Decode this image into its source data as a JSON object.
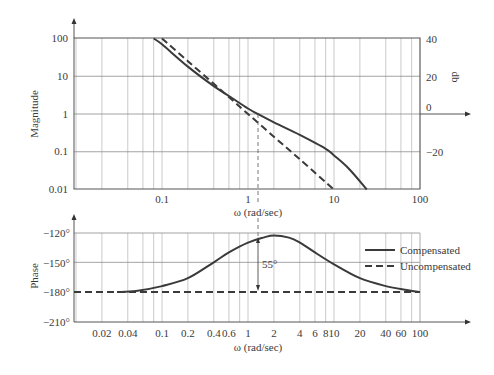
{
  "chart_data": [
    {
      "type": "line",
      "title": "",
      "xlabel": "ω (rad/sec)",
      "ylabel": "Magnitude",
      "ylabel_right": "db",
      "xscale": "log",
      "yscale": "log",
      "xlim": [
        0.01,
        100
      ],
      "ylim": [
        0.01,
        100
      ],
      "x_ticks": [
        "0.1",
        "1",
        "10",
        "100"
      ],
      "y_ticks": [
        "100",
        "10",
        "1",
        "0.1",
        "0.01"
      ],
      "y_ticks_right": [
        "40",
        "20",
        "0",
        "−20"
      ],
      "grid": true,
      "series": [
        {
          "name": "Compensated",
          "style": "solid",
          "x": [
            0.08,
            0.1,
            0.2,
            0.4,
            0.6,
            1.0,
            1.3,
            2,
            4,
            8,
            10,
            15,
            24
          ],
          "y": [
            100,
            70,
            18,
            5.5,
            3.0,
            1.4,
            1.0,
            0.6,
            0.28,
            0.12,
            0.08,
            0.035,
            0.01
          ]
        },
        {
          "name": "Uncompensated",
          "style": "dashed",
          "x": [
            0.1,
            0.2,
            0.4,
            0.6,
            1.0,
            2,
            4,
            10
          ],
          "y": [
            100,
            25,
            6.3,
            2.8,
            1.0,
            0.25,
            0.063,
            0.01
          ]
        }
      ],
      "annotations": [
        {
          "type": "vline",
          "x": 1.3,
          "style": "dashed",
          "note": "crossover frequency of compensated system"
        }
      ]
    },
    {
      "type": "line",
      "title": "",
      "xlabel": "ω (rad/sec)",
      "ylabel": "Phase",
      "xscale": "log",
      "xlim": [
        0.01,
        100
      ],
      "ylim": [
        -210,
        -120
      ],
      "x_ticks": [
        "0.02",
        "0.04",
        "0.1",
        "0.2",
        "0.4",
        "0.6",
        "1",
        "2",
        "4",
        "6",
        "8",
        "10",
        "20",
        "40",
        "60",
        "100"
      ],
      "y_ticks": [
        "−120°",
        "−150°",
        "−180°",
        "−210°"
      ],
      "grid": true,
      "legend": {
        "position": "right",
        "entries": [
          "Compensated",
          "Uncompensated"
        ]
      },
      "series": [
        {
          "name": "Compensated",
          "style": "solid",
          "x": [
            0.03,
            0.05,
            0.1,
            0.2,
            0.4,
            0.6,
            1,
            1.5,
            2,
            3,
            4,
            6,
            10,
            20,
            40,
            70,
            100
          ],
          "y": [
            -180,
            -179,
            -174,
            -166,
            -150,
            -140,
            -130,
            -125,
            -123,
            -125,
            -130,
            -140,
            -152,
            -166,
            -174,
            -178,
            -180
          ]
        },
        {
          "name": "Uncompensated",
          "style": "dashed",
          "x": [
            0.01,
            100
          ],
          "y": [
            -180,
            -180
          ]
        }
      ],
      "annotations": [
        {
          "type": "arrow",
          "x": 1.3,
          "from": -180,
          "to": -125,
          "label": "55°"
        }
      ]
    }
  ],
  "labels": {
    "mag_ylabel": "Magnitude",
    "db_label": "db",
    "phase_ylabel": "Phase",
    "mag_xlabel": "ω (rad/sec)",
    "phase_xlabel": "ω (rad/sec)",
    "phase_margin": "55°",
    "legend_comp": "Compensated",
    "legend_uncomp": "Uncompensated"
  },
  "mag_yticks": [
    "100",
    "10",
    "1",
    "0.1",
    "0.01"
  ],
  "db_ticks": [
    "40",
    "20",
    "0",
    "−20"
  ],
  "mag_xticks": [
    "0.1",
    "1",
    "10",
    "100"
  ],
  "phase_yticks": [
    "−120°",
    "−150°",
    "−180°",
    "−210°"
  ],
  "phase_xticks": [
    "0.02",
    "0.04",
    "0.1",
    "0.2",
    "0.4",
    "0.6",
    "1",
    "2",
    "4",
    "6",
    "8",
    "10",
    "20",
    "40",
    "60",
    "100"
  ]
}
